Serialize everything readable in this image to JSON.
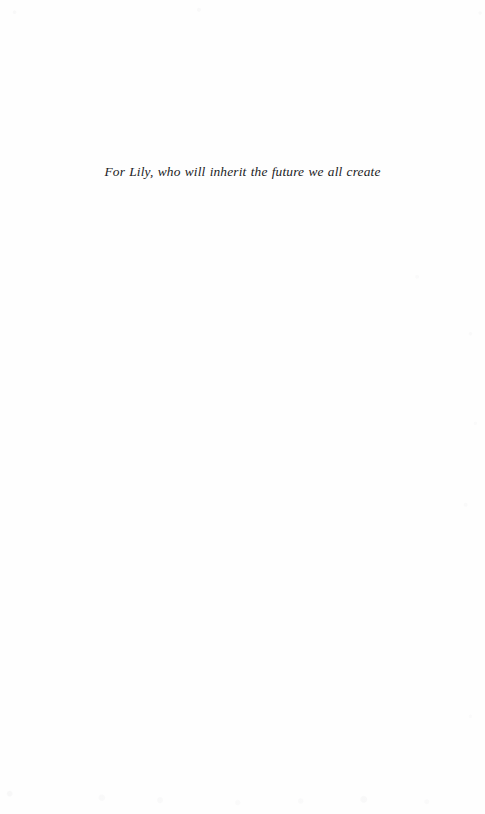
{
  "page": {
    "kind": "book-dedication-page",
    "width": 485,
    "height": 814,
    "background_color": "#fefefe",
    "ink_color": "#1b1b1d"
  },
  "dedication": {
    "text": "For Lily, who will inherit the future we all create",
    "alignment": "center",
    "style": "italic-serif"
  }
}
